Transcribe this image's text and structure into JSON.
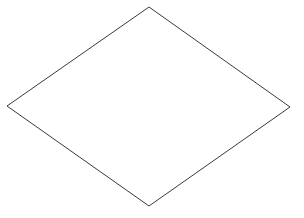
{
  "canvas": {
    "width": 304,
    "height": 218,
    "background_color": "#ffffff",
    "title": "Rhombus"
  },
  "figure": {
    "name": "rhombus",
    "shape_type": "polygon",
    "sides": 4,
    "fill_color": "none",
    "stroke_color": "#3a3a3a",
    "stroke_width": 1,
    "vertices": [
      {
        "label": "top",
        "x": 149,
        "y": 7
      },
      {
        "label": "right",
        "x": 290,
        "y": 107
      },
      {
        "label": "bottom",
        "x": 149,
        "y": 206
      },
      {
        "label": "left",
        "x": 7,
        "y": 106
      }
    ],
    "points_attr": "149,7 290,107 149,206 7,106",
    "diagonals": {
      "horizontal_length": 283,
      "vertical_length": 199
    }
  }
}
